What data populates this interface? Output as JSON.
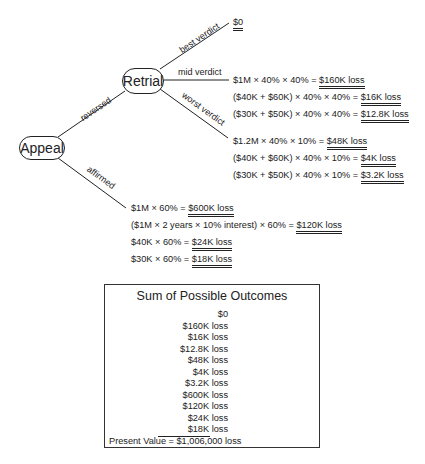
{
  "tree": {
    "root": {
      "label": "Appeal"
    },
    "retrial": {
      "label": "Retrial"
    },
    "edges": {
      "reversed": "reversed",
      "affirmed": "affirmed",
      "best": "best verdict",
      "mid": "mid verdict",
      "worst": "worst verdict"
    },
    "best_outcome": {
      "result": "$0"
    },
    "mid_outcomes": [
      {
        "expr": "$1M × 40% × 40% = ",
        "result": "$160K loss"
      },
      {
        "expr": "($40K + $60K) × 40% × 40% = ",
        "result": "$16K loss"
      },
      {
        "expr": "($30K + $50K) × 40% × 40% = ",
        "result": "$12.8K loss"
      }
    ],
    "worst_outcomes": [
      {
        "expr": "$1.2M × 40% × 10% = ",
        "result": "$48K loss"
      },
      {
        "expr": "($40K + $60K) × 40% × 10% = ",
        "result": "$4K loss"
      },
      {
        "expr": "($30K + $50K) × 40% × 10% = ",
        "result": "$3.2K loss"
      }
    ],
    "affirmed_outcomes": [
      {
        "expr": "$1M × 60% = ",
        "result": "$600K loss"
      },
      {
        "expr": "($1M × 2 years × 10% interest) × 60% = ",
        "result": "$120K loss"
      },
      {
        "expr": "$40K × 60% = ",
        "result": "$24K loss"
      },
      {
        "expr": "$30K × 60% = ",
        "result": "$18K loss"
      }
    ]
  },
  "summary": {
    "title": "Sum of Possible Outcomes",
    "items": [
      "$0",
      "$160K loss",
      "$16K loss",
      "$12.8K loss",
      "$48K loss",
      "$4K loss",
      "$3.2K loss",
      "$600K loss",
      "$120K loss",
      "$24K loss",
      "$18K loss"
    ],
    "present_value": "Present Value = $1,006,000 loss"
  }
}
